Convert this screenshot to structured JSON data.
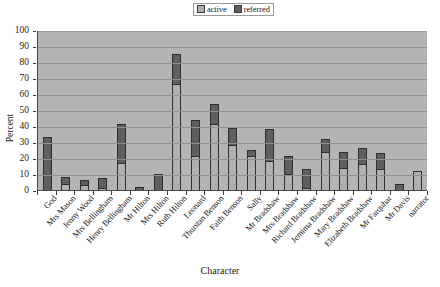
{
  "chart_data": {
    "type": "bar",
    "title": "",
    "xlabel": "Character",
    "ylabel": "Percent",
    "ylim": [
      0,
      100
    ],
    "ytick_step": 10,
    "yticks": [
      "0",
      "10",
      "20",
      "30",
      "40",
      "50",
      "60",
      "70",
      "80",
      "90",
      "100"
    ],
    "grid": true,
    "stacked": true,
    "legend_position": "top-center",
    "legend": [
      "active",
      "referred"
    ],
    "colors": {
      "active": "#b0b0b0",
      "referred": "#5f5f5f",
      "plot_background": "#b4b4b4",
      "gridline": "#8f8f8f",
      "axis": "#3a3a3a"
    },
    "categories": [
      "God",
      "Mrs Mason",
      "Jenny Wood",
      "Mrs Bellingham",
      "Henry Bellingham",
      "Mr Hilton",
      "Mrs Hilton",
      "Ruth Hilton",
      "Leonard",
      "Thurstan Benson",
      "Faith Benson",
      "Sally",
      "Mr Bradshaw",
      "Mrs Bradshaw",
      "Richard Bradshaw",
      "Jemima Bradshaw",
      "Mary Bradshaw",
      "Elizabeth Bradshaw",
      "Mr Farquhar",
      "Mr Davis",
      "narrator"
    ],
    "series": [
      {
        "name": "active",
        "values": [
          0,
          4,
          3,
          1,
          17,
          0,
          0,
          66,
          21,
          41,
          28,
          21,
          18,
          10,
          1,
          24,
          14,
          16,
          13,
          0,
          12
        ]
      },
      {
        "name": "referred",
        "values": [
          33,
          4,
          3,
          6,
          24,
          2,
          10,
          19,
          23,
          13,
          11,
          4,
          20,
          11,
          12,
          8,
          10,
          10,
          10,
          4,
          0
        ]
      }
    ],
    "totals": [
      33,
      8,
      6,
      7,
      41,
      2,
      10,
      85,
      44,
      54,
      39,
      25,
      38,
      21,
      13,
      32,
      24,
      26,
      23,
      4,
      12
    ]
  }
}
